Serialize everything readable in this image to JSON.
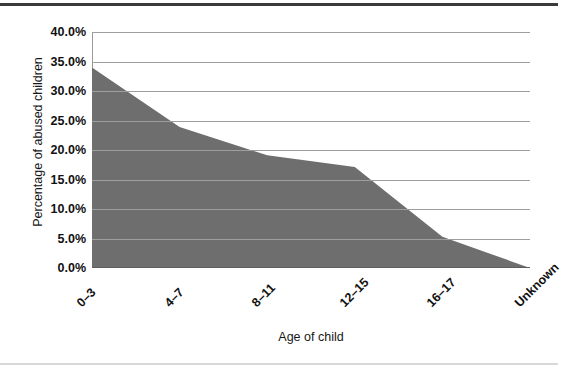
{
  "chart_data": {
    "type": "area",
    "title": "",
    "subtitle": "",
    "xlabel": "Age of child",
    "ylabel": "Percentage of abused children",
    "categories": [
      "0–3",
      "4–7",
      "8–11",
      "12–15",
      "16–17",
      "Unknown"
    ],
    "values": [
      34.0,
      23.9,
      19.1,
      17.1,
      5.3,
      0.0
    ],
    "value_labels": [
      "34.0%",
      "23.9%",
      "19.1%",
      "17.1%",
      "5.3%",
      "0.0%"
    ],
    "series": [
      {
        "name": "Percentage of abused children",
        "values": [
          34.0,
          23.9,
          19.1,
          17.1,
          5.3,
          0.0
        ]
      }
    ],
    "ylim": [
      0,
      40
    ],
    "ytick_values": [
      0,
      5,
      10,
      15,
      20,
      25,
      30,
      35,
      40
    ],
    "ytick_labels": [
      "0.0%",
      "5.0%",
      "10.0%",
      "15.0%",
      "20.0%",
      "25.0%",
      "30.0%",
      "35.0%",
      "40.0%"
    ],
    "grid": true,
    "grid_axis": "y",
    "legend": false,
    "legend_position": "none",
    "annotations": [],
    "colors": {
      "area_fill": "#6e6e6e",
      "gridline": "#9e9e9e",
      "axis": "#5e5e5e",
      "text": "#111111",
      "background": "#ffffff"
    }
  },
  "figure": {
    "x_axis_title": "Age of child",
    "y_axis_title": "Percentage of abused children"
  }
}
